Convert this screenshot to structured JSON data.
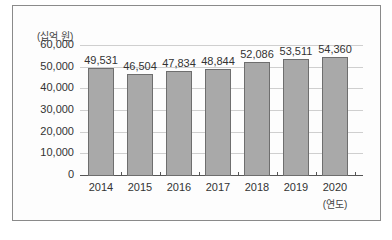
{
  "chart_data": {
    "type": "bar",
    "title": "",
    "xlabel": "(연도)",
    "ylabel": "(십억 원)",
    "categories": [
      "2014",
      "2015",
      "2016",
      "2017",
      "2018",
      "2019",
      "2020"
    ],
    "values": [
      49531,
      46504,
      47834,
      48844,
      52086,
      53511,
      54360
    ],
    "value_labels": [
      "49,531",
      "46,504",
      "47,834",
      "48,844",
      "52,086",
      "53,511",
      "54,360"
    ],
    "ylim": [
      0,
      60000
    ],
    "yticks": [
      "0",
      "10,000",
      "20,000",
      "30,000",
      "40,000",
      "50,000",
      "60,000"
    ],
    "grid": true,
    "legend": null,
    "bar_color": "#a9a9a9",
    "bar_border_color": "#6e6e6e"
  }
}
